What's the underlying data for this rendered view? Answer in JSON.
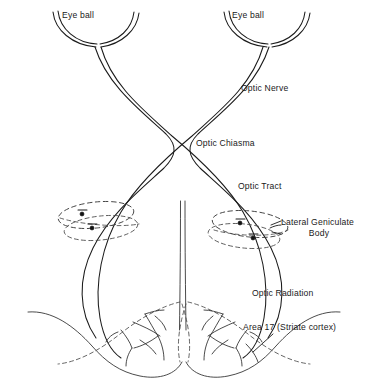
{
  "figure": {
    "background_color": "#ffffff",
    "line_color": "#1b1b1b",
    "dashed_color": "#3a3a3a"
  },
  "labels": {
    "eye_ball_left": "Eye ball",
    "eye_ball_right": "Eye ball",
    "optic_nerve": "Optic Nerve",
    "optic_chiasma": "Optic Chiasma",
    "optic_tract": "Optic Tract",
    "lateral_geniculate_line1": "Lateral Geniculate",
    "lateral_geniculate_line2": "Body",
    "optic_radiation": "Optic Radiation",
    "area_17": "Area 17 (Striate cortex)"
  },
  "structures": [
    {
      "name": "eye-ball-left",
      "kind": "arc-cup",
      "side": "left"
    },
    {
      "name": "eye-ball-right",
      "kind": "arc-cup",
      "side": "right"
    },
    {
      "name": "optic-nerve-left",
      "kind": "double-line-bundle",
      "side": "left"
    },
    {
      "name": "optic-nerve-right",
      "kind": "double-line-bundle",
      "side": "right"
    },
    {
      "name": "optic-chiasma",
      "kind": "x-crossing"
    },
    {
      "name": "optic-tract-left",
      "kind": "double-line-bundle",
      "side": "left"
    },
    {
      "name": "optic-tract-right",
      "kind": "double-line-bundle",
      "side": "right"
    },
    {
      "name": "lateral-geniculate-body-left",
      "kind": "dashed-ellipse",
      "side": "left",
      "synapses": 2
    },
    {
      "name": "lateral-geniculate-body-right",
      "kind": "dashed-ellipse",
      "side": "right",
      "synapses": 2
    },
    {
      "name": "midline",
      "kind": "double-vertical-line"
    },
    {
      "name": "optic-radiation-left",
      "kind": "double-line-bundle",
      "side": "left"
    },
    {
      "name": "optic-radiation-right",
      "kind": "double-line-bundle",
      "side": "right"
    },
    {
      "name": "occipital-lobe-left",
      "kind": "lobe-outline",
      "side": "left"
    },
    {
      "name": "occipital-lobe-right",
      "kind": "lobe-outline",
      "side": "right"
    },
    {
      "name": "striate-cortex-branches-left",
      "kind": "branching-fibers",
      "side": "left"
    },
    {
      "name": "striate-cortex-branches-right",
      "kind": "branching-fibers",
      "side": "right"
    }
  ],
  "leader_lines": [
    {
      "name": "leader-lateral-geniculate",
      "from": "Lateral Geniculate Body",
      "to": "lateral-geniculate-body-right"
    },
    {
      "name": "leader-area-17",
      "from": "Area 17 (Striate cortex)",
      "to": "striate-cortex-branches-right"
    }
  ]
}
